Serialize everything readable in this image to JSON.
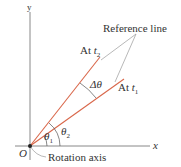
{
  "diagram": {
    "axes": {
      "y_label": "y",
      "x_label": "x",
      "origin_label": "O"
    },
    "labels": {
      "reference_line": "Reference line",
      "at_t2_prefix": "At ",
      "at_t2_var": "t",
      "at_t2_sub": "2",
      "at_t1_prefix": "At ",
      "at_t1_var": "t",
      "at_t1_sub": "1",
      "delta_theta": "Δθ",
      "theta1": "θ",
      "theta1_sub": "1",
      "theta2": "θ",
      "theta2_sub": "2",
      "rotation_axis": "Rotation axis"
    },
    "colors": {
      "reference_line": "#d9674a",
      "axes": "#888888",
      "pointer": "#999999",
      "text": "#333333"
    }
  }
}
